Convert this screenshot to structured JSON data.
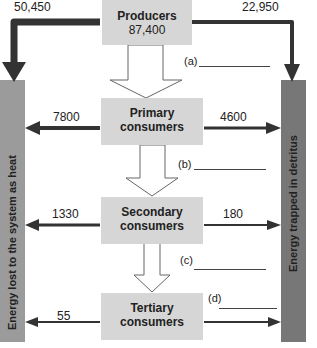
{
  "nodes": {
    "producers": {
      "title": "Producers",
      "value": "87,400"
    },
    "primary": {
      "title_line1": "Primary",
      "title_line2": "consumers"
    },
    "secondary": {
      "title_line1": "Secondary",
      "title_line2": "consumers"
    },
    "tertiary": {
      "title_line1": "Tertiary",
      "title_line2": "consumers"
    }
  },
  "sinks": {
    "heat": "Energy lost to the system as heat",
    "detritus": "Energy trapped in detritus"
  },
  "flows": {
    "producers_heat": "50,450",
    "producers_detritus": "22,950",
    "primary_heat": "7800",
    "primary_detritus": "4600",
    "secondary_heat": "1330",
    "secondary_detritus": "180",
    "tertiary_heat": "55"
  },
  "blanks": {
    "a": "(a)",
    "b": "(b)",
    "c": "(c)",
    "d": "(d)"
  },
  "colors": {
    "box": "#d6d6d6",
    "heat_bar": "#9b9b9b",
    "detritus_bar": "#777777",
    "arrow": "#333333"
  }
}
